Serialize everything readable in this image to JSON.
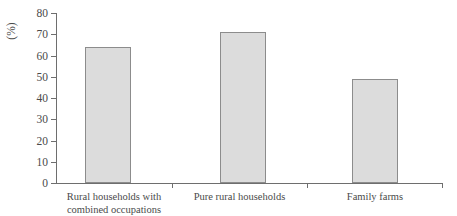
{
  "chart_data": {
    "type": "bar",
    "title": "",
    "xlabel": "",
    "ylabel": "(%)",
    "categories": [
      "Rural households with\ncombined occupations",
      "Pure rural households",
      "Family farms"
    ],
    "values": [
      64,
      71,
      49
    ],
    "ylim": [
      0,
      80
    ],
    "ytick_labels": [
      "80",
      "70",
      "60",
      "50",
      "40",
      "30",
      "20",
      "10",
      "0"
    ],
    "ytick_values": [
      80,
      70,
      60,
      50,
      40,
      30,
      20,
      10,
      0
    ],
    "ytick_step": 10,
    "grid": false,
    "legend": false,
    "bar_fill_color": "#dcdcdc",
    "bar_border_color": "#8c8c8c",
    "axis_color": "#6e6e6e",
    "background_color": "#ffffff"
  }
}
